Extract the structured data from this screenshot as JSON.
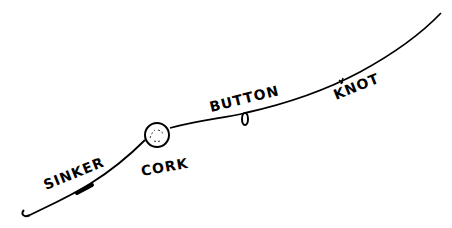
{
  "diagram": {
    "line_color": "#000000",
    "background": "#ffffff",
    "labels": {
      "sinker": "SINKER",
      "cork": "CORK",
      "button": "BUTTON",
      "knot": "KNOT"
    },
    "components": [
      {
        "id": "hook",
        "icon": "hook-icon"
      },
      {
        "id": "sinker",
        "icon": "sinker-icon",
        "label": "SINKER"
      },
      {
        "id": "cork",
        "icon": "cork-float-icon",
        "label": "CORK"
      },
      {
        "id": "button",
        "icon": "button-stop-icon",
        "label": "BUTTON"
      },
      {
        "id": "knot",
        "icon": "knot-icon",
        "label": "KNOT"
      }
    ]
  }
}
